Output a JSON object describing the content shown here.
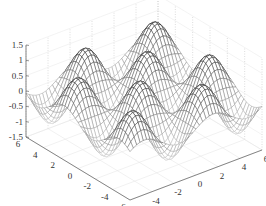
{
  "chart_data": {
    "type": "surface",
    "title": "",
    "function": "z = sin(x) * sin(y)",
    "xlabel": "",
    "ylabel": "",
    "zlabel": "",
    "x_range": [
      -6,
      6
    ],
    "y_range": [
      -6,
      6
    ],
    "zlim": [
      -1.5,
      1.5
    ],
    "x_ticks": [
      -6,
      -4,
      -2,
      0,
      2,
      4,
      6
    ],
    "y_ticks": [
      -6,
      -4,
      -2,
      0,
      2,
      4,
      6
    ],
    "z_ticks": [
      -1.5,
      -1,
      -0.5,
      0,
      0.5,
      1,
      1.5
    ],
    "x_tick_labels": [
      "-6",
      "-4",
      "-2",
      "0",
      "2",
      "4",
      "6"
    ],
    "y_tick_labels": [
      "-6",
      "-4",
      "-2",
      "0",
      "2",
      "4",
      "6"
    ],
    "z_tick_labels": [
      "-1.5",
      "-1",
      "-0.5",
      "0",
      "0.5",
      "1",
      "1.5"
    ],
    "grid": true,
    "mesh_resolution": 40,
    "style": "mesh",
    "colors": {
      "mesh_high": "#1a1a1a",
      "mesh_low": "#d8d8d8",
      "axis": "#555555",
      "grid": "#bbbbbb"
    }
  }
}
